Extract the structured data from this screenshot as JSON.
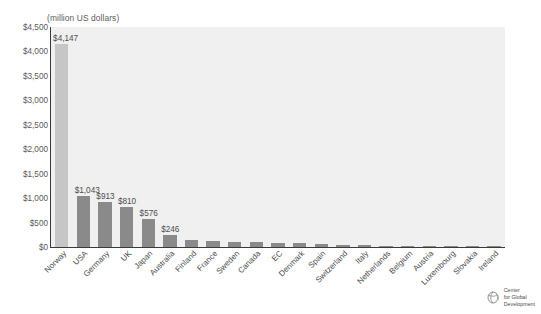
{
  "chart_data": {
    "type": "bar",
    "title": "",
    "subtitle": "",
    "xlabel": "",
    "ylabel": "(million US dollars)",
    "ylim": [
      0,
      4500
    ],
    "grid": false,
    "legend_position": "none",
    "categories": [
      "Norway",
      "USA",
      "Germany",
      "UK",
      "Japan",
      "Australia",
      "Finland",
      "France",
      "Sweden",
      "Canada",
      "EC",
      "Denmark",
      "Spain",
      "Switzerland",
      "Italy",
      "Netherlands",
      "Belgium",
      "Austria",
      "Luxembourg",
      "Slovakia",
      "Ireland"
    ],
    "values": [
      4147,
      1043,
      913,
      810,
      576,
      246,
      150,
      130,
      108,
      105,
      80,
      74,
      66,
      50,
      34,
      30,
      26,
      22,
      12,
      8,
      5
    ],
    "value_labels": [
      "$4,147",
      "$1,043",
      "$913",
      "$810",
      "$576",
      "$246",
      "",
      "",
      "",
      "",
      "",
      "",
      "",
      "",
      "",
      "",
      "",
      "",
      "",
      "",
      ""
    ],
    "highlight_index": 0,
    "ytick_labels": [
      "$4,500",
      "$4,000",
      "$3,500",
      "$3,000",
      "$2,500",
      "$2,000",
      "$1,500",
      "$1,000",
      "$500",
      "$0"
    ],
    "ytick_values": [
      4500,
      4000,
      3500,
      3000,
      2500,
      2000,
      1500,
      1000,
      500,
      0
    ],
    "colors": {
      "bar": "#8a8a8a",
      "bar_highlight": "#c6c6c6",
      "plot_background": "#f0f0f0",
      "axis": "#3a3a3a",
      "text": "#4d4d4f"
    }
  },
  "axis_caption": "(million US dollars)",
  "logo": {
    "line1": "Center",
    "line2": "for Global",
    "line3": "Development"
  }
}
